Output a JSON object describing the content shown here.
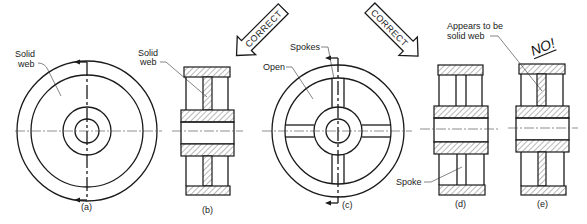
{
  "figure": {
    "views": [
      {
        "id": "a",
        "caption": "(a)",
        "labels": [
          "Solid",
          "web"
        ],
        "type": "front-view-solid-web"
      },
      {
        "id": "b",
        "caption": "(b)",
        "labels": [
          "Solid",
          "web"
        ],
        "type": "section-solid-web"
      },
      {
        "id": "c",
        "caption": "(c)",
        "labels": [
          "Spokes",
          "Open"
        ],
        "type": "front-view-spoked"
      },
      {
        "id": "d",
        "caption": "(d)",
        "labels": [
          "Spoke"
        ],
        "type": "section-spoke-correct"
      },
      {
        "id": "e",
        "caption": "(e)",
        "labels": [
          "Appears to be",
          "solid web"
        ],
        "type": "section-spoke-incorrect"
      }
    ],
    "arrows": [
      {
        "text": "CORRECT",
        "points_to": "b"
      },
      {
        "text": "CORRECT",
        "points_to": "d"
      }
    ],
    "warning": "NO!"
  }
}
